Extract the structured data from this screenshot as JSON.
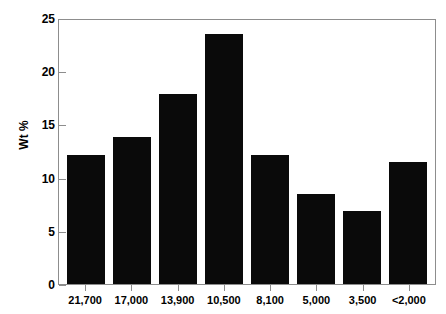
{
  "chart_data": {
    "type": "bar",
    "title": "",
    "subtitle": "",
    "xlabel": "",
    "ylabel": "Wt %",
    "categories": [
      "21,700",
      "17,000",
      "13,900",
      "10,500",
      "8,100",
      "5,000",
      "3,500",
      "<2,000"
    ],
    "values": [
      12.2,
      13.9,
      18.0,
      23.7,
      12.2,
      8.5,
      6.9,
      11.6
    ],
    "ylim": [
      0,
      25
    ],
    "yticks": [
      0,
      5,
      10,
      15,
      20,
      25
    ],
    "ytick_labels": [
      "0",
      "5",
      "10",
      "15",
      "20",
      "25"
    ],
    "xtick_labels": [
      "21,700",
      "17,000",
      "13,900",
      "10,500",
      "8,100",
      "5,000",
      "3,500",
      "<2,000"
    ],
    "grid": false,
    "legend": null,
    "legend_position": "none",
    "annotations": [],
    "bar_color": "#0a0a0a",
    "frame_color": "#8d8d8d",
    "background_color": "#ffffff"
  }
}
